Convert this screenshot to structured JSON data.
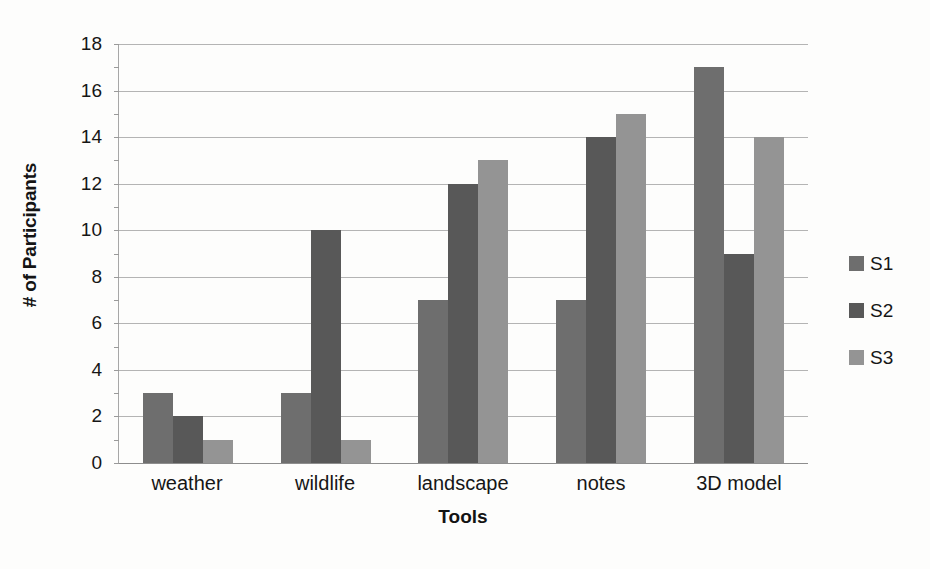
{
  "chart_data": {
    "type": "bar",
    "title": "",
    "subtitle": "",
    "xlabel": "Tools",
    "ylabel": "# of Participants",
    "categories": [
      "weather",
      "wildlife",
      "landscape",
      "notes",
      "3D model"
    ],
    "series": [
      {
        "name": "S1",
        "values": [
          3,
          3,
          7,
          7,
          17
        ],
        "color": "#6e6e6e"
      },
      {
        "name": "S2",
        "values": [
          2,
          10,
          12,
          14,
          9
        ],
        "color": "#585858"
      },
      {
        "name": "S3",
        "values": [
          1,
          1,
          13,
          15,
          14
        ],
        "color": "#949494"
      }
    ],
    "ylim": [
      0,
      18
    ],
    "yticks": [
      0,
      2,
      4,
      6,
      8,
      10,
      12,
      14,
      16,
      18
    ],
    "ytick_labels": [
      "0",
      "2",
      "4",
      "6",
      "8",
      "10",
      "12",
      "14",
      "16",
      "18"
    ],
    "grid": true,
    "grid_axis": "y",
    "legend_position": "right",
    "legend_entries": [
      "S1",
      "S2",
      "S3"
    ],
    "bar_grouping": "grouped",
    "annotations": []
  },
  "colors": {
    "background": "#fdfdfc",
    "gridline": "#b4b4b4",
    "axis": "#a7a7a7",
    "text": "#161616",
    "series_s1": "#6e6e6e",
    "series_s2": "#585858",
    "series_s3": "#949494"
  }
}
